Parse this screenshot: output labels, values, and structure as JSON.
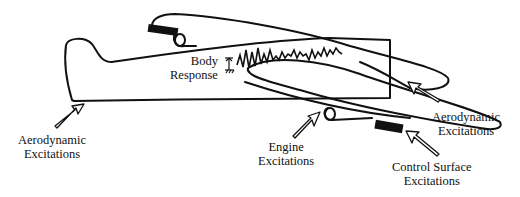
{
  "diagram": {
    "labels": {
      "aero_left_1": "Aerodynamic",
      "aero_left_2": "Excitations",
      "body_1": "Body",
      "body_2": "Response",
      "engine_1": "Engine",
      "engine_2": "Excitations",
      "aero_right_1": "Aerodynamic",
      "aero_right_2": "Excitations",
      "control_1": "Control Surface",
      "control_2": "Excitations"
    },
    "colors": {
      "line": "#111111",
      "background": "#ffffff"
    }
  }
}
